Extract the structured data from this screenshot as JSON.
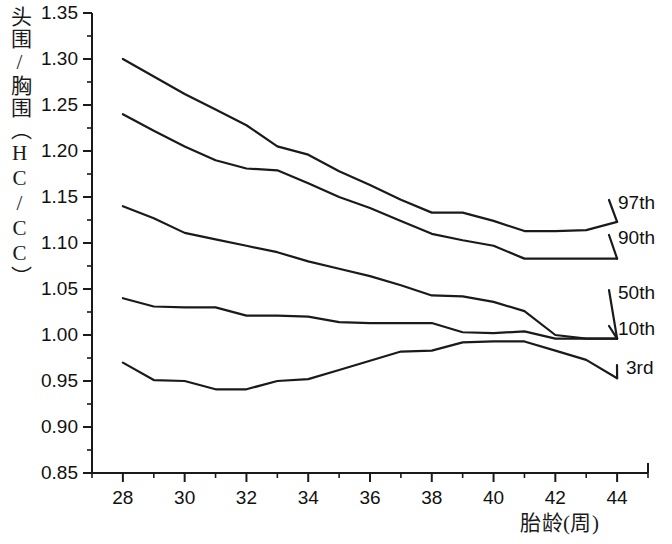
{
  "chart_data": {
    "type": "line",
    "title": "",
    "xlabel": "胎龄(周)",
    "ylabel": "头围/胸围（HC/CC）",
    "xlim": [
      27,
      45
    ],
    "ylim": [
      0.85,
      1.35
    ],
    "xticks": [
      28,
      30,
      32,
      34,
      36,
      38,
      40,
      42,
      44
    ],
    "xtick_labels": [
      "28",
      "30",
      "32",
      "34",
      "36",
      "38",
      "40",
      "42",
      "44"
    ],
    "x_minor_step": 1,
    "yticks": [
      0.85,
      0.9,
      0.95,
      1.0,
      1.05,
      1.1,
      1.15,
      1.2,
      1.25,
      1.3,
      1.35
    ],
    "ytick_labels": [
      "0.85",
      "0.90",
      "0.95",
      "1.00",
      "1.05",
      "1.10",
      "1.15",
      "1.20",
      "1.25",
      "1.30",
      "1.35"
    ],
    "y_minor_step": 0.025,
    "grid": false,
    "legend_position": "right-inline",
    "line_color": "#1a1a1a",
    "line_width": 2.2,
    "x": [
      28,
      29,
      30,
      31,
      32,
      33,
      34,
      35,
      36,
      37,
      38,
      39,
      40,
      41,
      42,
      43,
      44
    ],
    "series": [
      {
        "name": "97th",
        "label": "97th",
        "values": [
          1.3,
          1.281,
          1.262,
          1.245,
          1.228,
          1.205,
          1.196,
          1.178,
          1.163,
          1.147,
          1.133,
          1.133,
          1.124,
          1.113,
          1.113,
          1.114,
          1.123
        ]
      },
      {
        "name": "90th",
        "label": "90th",
        "values": [
          1.24,
          1.222,
          1.205,
          1.19,
          1.181,
          1.179,
          1.165,
          1.15,
          1.138,
          1.124,
          1.11,
          1.103,
          1.097,
          1.083,
          1.083,
          1.083,
          1.083
        ]
      },
      {
        "name": "50th",
        "label": "50th",
        "values": [
          1.14,
          1.127,
          1.111,
          1.104,
          1.097,
          1.09,
          1.08,
          1.072,
          1.064,
          1.054,
          1.043,
          1.042,
          1.036,
          1.026,
          1.0,
          0.996,
          0.996
        ]
      },
      {
        "name": "10th",
        "label": "10th",
        "values": [
          1.04,
          1.031,
          1.03,
          1.03,
          1.021,
          1.021,
          1.02,
          1.014,
          1.013,
          1.013,
          1.013,
          1.003,
          1.002,
          1.004,
          0.996,
          0.996,
          0.996
        ]
      },
      {
        "name": "3rd",
        "label": "3rd",
        "values": [
          0.97,
          0.951,
          0.95,
          0.941,
          0.941,
          0.95,
          0.952,
          0.962,
          0.972,
          0.982,
          0.983,
          0.992,
          0.993,
          0.993,
          0.983,
          0.973,
          0.953
        ]
      }
    ]
  },
  "axis_geometry": {
    "plot_left": 92,
    "plot_right": 648,
    "plot_top": 13,
    "plot_bottom": 473
  },
  "series_label_positions": [
    {
      "key": "97th",
      "x": 618,
      "y": 206
    },
    {
      "key": "90th",
      "x": 618,
      "y": 241
    },
    {
      "key": "50th",
      "x": 618,
      "y": 296
    },
    {
      "key": "10th",
      "x": 618,
      "y": 332
    },
    {
      "key": "3rd",
      "x": 626,
      "y": 371
    }
  ]
}
